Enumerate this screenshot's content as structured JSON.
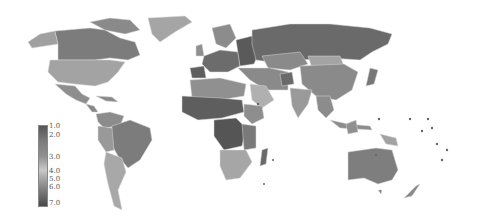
{
  "map": {
    "type": "choropleth",
    "colorscale": "grayscale",
    "legend": {
      "ticks": [
        "1.0",
        "2.0",
        "3.0",
        "4.0",
        "5.0",
        "6.0",
        "7.0"
      ],
      "tick_positions": [
        0,
        10,
        32,
        46,
        54,
        62,
        78
      ]
    }
  },
  "colors": {
    "background": "#ffffff",
    "dark": "#5a5a5a",
    "mid": "#7e7e7e",
    "light": "#a8a8a8",
    "lighter": "#bdbdbd",
    "darkest": "#454545"
  }
}
